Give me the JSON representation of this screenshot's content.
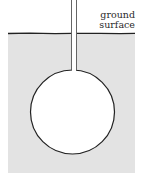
{
  "diagram": {
    "labels": {
      "ground_line1": "ground",
      "ground_line2": "surface"
    },
    "colors": {
      "ground_fill": "#e3e3e3",
      "outline": "#222222",
      "cavity_fill": "#ffffff"
    },
    "geometry": {
      "ground_surface_y": 33,
      "ground_left_x": 8,
      "ground_right_x": 135,
      "ground_bottom_y": 173,
      "cavity_center_x": 72.5,
      "cavity_center_y": 112,
      "cavity_radius": 42,
      "pipe_left_x": 71.5,
      "pipe_right_x": 76.5,
      "pipe_top_y": 0
    }
  }
}
